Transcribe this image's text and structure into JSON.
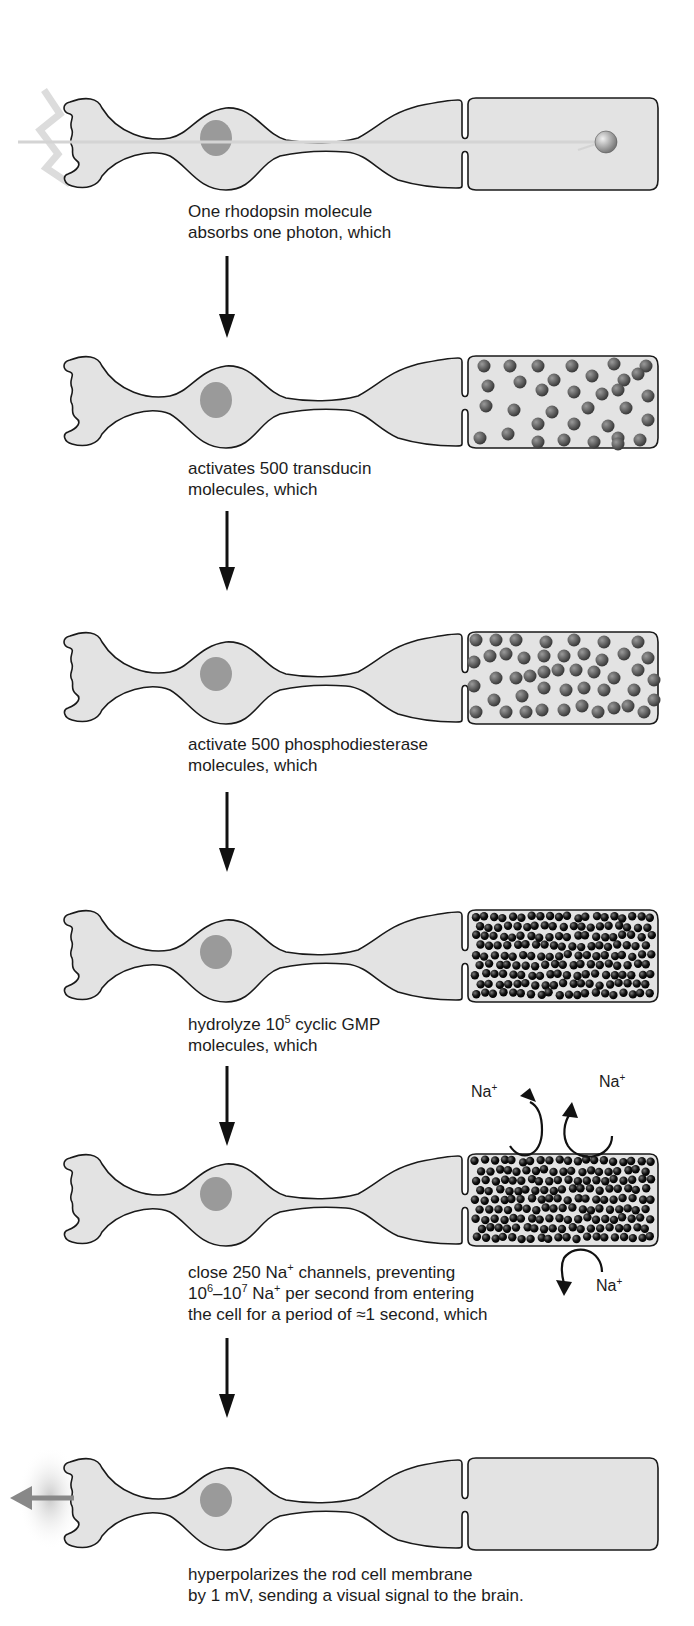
{
  "figure": {
    "colors": {
      "cell_fill": "#e3e3e3",
      "cell_outline": "#1a1a1a",
      "nucleus": "#9a9a9a",
      "molecule_gray": "#5a5a5a",
      "molecule_dark": "#111111",
      "photon_ray": "#d8d8d8",
      "signal_arrow": "#8a8a8a",
      "flow_arrow": "#111111"
    },
    "stages": [
      {
        "id": 1,
        "line1": "One rhodopsin molecule",
        "line2": "absorbs one photon, which",
        "molecules": 1,
        "molecule_style": "single-rhodopsin"
      },
      {
        "id": 2,
        "line1": "activates 500 transducin",
        "line2": "molecules, which",
        "molecules": 40,
        "molecule_style": "sparse-gray"
      },
      {
        "id": 3,
        "line1": "activate 500 phosphodiesterase",
        "line2": "molecules, which",
        "molecules": 55,
        "molecule_style": "medium-gray"
      },
      {
        "id": 4,
        "line1_pre": "hydrolyze 10",
        "line1_sup": "5",
        "line1_post": " cyclic GMP",
        "line2": "molecules, which",
        "molecule_style": "dense-black"
      },
      {
        "id": 5,
        "line1_pre": "close 250 Na",
        "line1_sup": "+",
        "line1_post": " channels, preventing",
        "line2_a": "10",
        "line2_sup1": "6",
        "line2_b": "–10",
        "line2_sup2": "7",
        "line2_c": " Na",
        "line2_sup3": "+",
        "line2_d": " per second from entering",
        "line3": "the cell for a period of ≈1 second, which",
        "molecule_style": "dense-black",
        "na_labels": [
          {
            "text": "Na",
            "sup": "+"
          },
          {
            "text": "Na",
            "sup": "+"
          },
          {
            "text": "Na",
            "sup": "+"
          }
        ]
      },
      {
        "id": 6,
        "line1": "hyperpolarizes the rod cell membrane",
        "line2": "by 1 mV, sending a visual signal to the brain.",
        "molecule_style": "none"
      }
    ]
  }
}
